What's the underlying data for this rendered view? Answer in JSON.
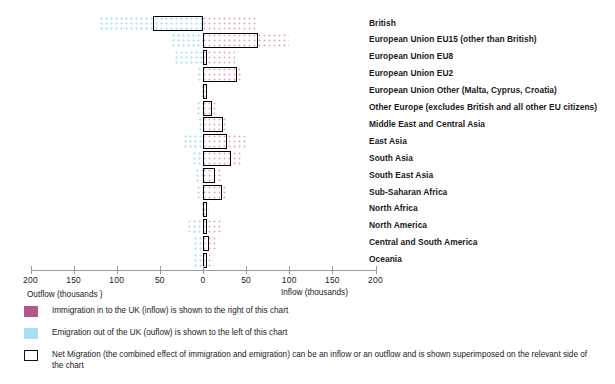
{
  "chart_data": {
    "type": "bar",
    "subtype": "diverging-horizontal-population-pyramid",
    "title": "",
    "xlabel_left": "Outflow  (thousands )",
    "xlabel_right": "Inflow (thousands)",
    "ylabel": "",
    "xlim": [
      -200,
      200
    ],
    "xticks": [
      200,
      150,
      100,
      50,
      0,
      50,
      100,
      150,
      200
    ],
    "grid": false,
    "legend_position": "bottom-left",
    "categories": [
      "British",
      "European Union EU15 (other than British)",
      "European Union EU8",
      "European Union EU2",
      "European Union Other (Malta, Cyprus, Croatia)",
      "Other Europe (excludes British and all other EU citizens)",
      "Middle East and Central Asia",
      "East Asia",
      "South Asia",
      "South East Asia",
      "Sub-Saharan Africa",
      "North Africa",
      "North America",
      "Central and South America",
      "Oceania"
    ],
    "series": [
      {
        "name": "Immigration in to the UK (inflow)",
        "direction": "right",
        "color": "#b4578a",
        "values": [
          62,
          100,
          37,
          45,
          4,
          17,
          28,
          50,
          45,
          22,
          29,
          7,
          22,
          18,
          13
        ]
      },
      {
        "name": "Emigration out of the UK (outflow)",
        "direction": "left",
        "color": "#a8dff4",
        "values": [
          120,
          36,
          32,
          6,
          2,
          7,
          5,
          22,
          12,
          8,
          7,
          2,
          17,
          11,
          10
        ]
      },
      {
        "name": "Net Migration",
        "direction": "net",
        "color": "#000000",
        "values": [
          -58,
          64,
          5,
          39,
          2,
          10,
          23,
          28,
          33,
          14,
          22,
          5,
          5,
          7,
          3
        ]
      }
    ]
  },
  "axis": {
    "ticks": [
      "200",
      "150",
      "100",
      "50",
      "0",
      "50",
      "100",
      "150",
      "200"
    ],
    "outflow_caption": "Outflow  (thousands )",
    "inflow_caption": "Inflow (thousands)"
  },
  "legend": {
    "items": [
      {
        "swatch": "pink",
        "text": "Immigration in to the UK (inflow) is shown to the right of this chart"
      },
      {
        "swatch": "blue",
        "text": "Emigration out of the UK (ouflow) is shown to the left of this chart"
      },
      {
        "swatch": "net",
        "text": "Net Migration (the combined effect of immigration and emigration) can be an inflow or an outflow and is shown superimposed on the relevant side of the chart"
      }
    ]
  },
  "colors": {
    "inflow": "#b4578a",
    "outflow": "#a8dff4",
    "net_outline": "#000000",
    "axis": "#9a9a9a",
    "text": "#1a1a1a"
  }
}
